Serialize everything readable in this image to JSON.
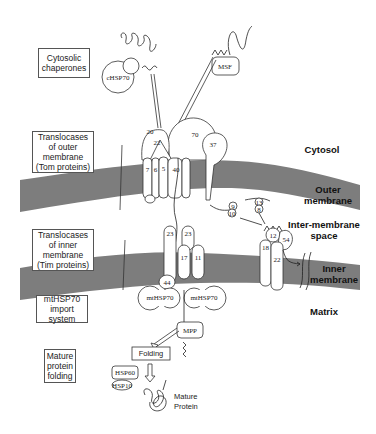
{
  "colors": {
    "membrane": "#7d7d7d",
    "outline": "#333333",
    "background": "#ffffff"
  },
  "side_labels": {
    "cytosolic_chaperones": "Cytosolic chaperones",
    "tom": "Translocases of outer membrane (Tom proteins)",
    "tim": "Translocases of inner membrane (Tim proteins)",
    "mthsp70_system": "mtHSP70 import system",
    "mature_folding": "Mature protein folding"
  },
  "regions": {
    "cytosol": "Cytosol",
    "outer_membrane": "Outer membrane",
    "intermembrane_space": "Inter-membrane space",
    "inner_membrane": "Inner membrane",
    "matrix": "Matrix"
  },
  "proteins": {
    "chsp70": "cHSP70",
    "msf": "MSF",
    "tom20": "20",
    "tom22": "22",
    "tom70": "70",
    "tom7": "7",
    "tom6": "6",
    "tom5": "5",
    "tom40": "40",
    "tom37": "37",
    "tim9": "9",
    "tim10": "10",
    "tim13": "13",
    "tim8": "8",
    "tim12": "12",
    "tim54": "54",
    "tim18": "18",
    "tim22": "22",
    "tim23a": "23",
    "tim23b": "23",
    "tim17": "17",
    "tim11": "11",
    "tim44": "44",
    "mthsp70_left": "mtHSP70",
    "mthsp70_right": "mtHSP70",
    "mpp": "MPP",
    "folding": "Folding",
    "hsp60": "HSP60",
    "hsp10": "HSP10",
    "mature_protein": "Mature Protein"
  }
}
